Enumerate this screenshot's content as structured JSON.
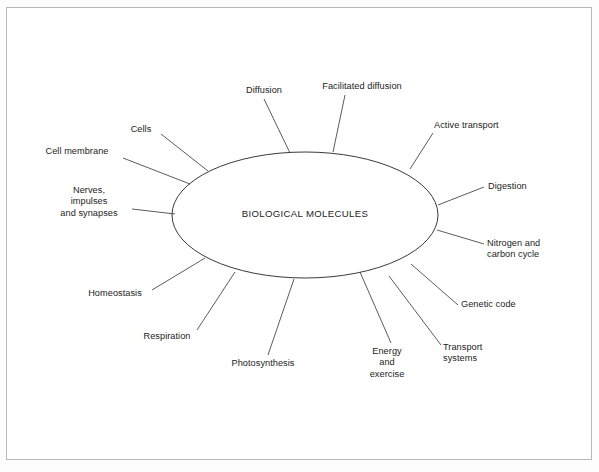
{
  "diagram": {
    "type": "mind-map",
    "center": {
      "label": "BIOLOGICAL MOLECULES",
      "shape": "ellipse",
      "cx": 305,
      "cy": 215,
      "rx": 133,
      "ry": 63
    },
    "style": {
      "page_background": "#fdfdfd",
      "frame_background": "#ffffff",
      "frame_border_color": "#b8b8b8",
      "line_color": "#4a4a4a",
      "ellipse_stroke": "#3a3a3a",
      "text_color": "#1c1c1c"
    },
    "branches": [
      {
        "id": "diffusion",
        "label": "Diffusion",
        "lines": [
          "Diffusion"
        ],
        "align": "center",
        "text_x": 236,
        "text_y": 85,
        "text_w": 56,
        "leader": {
          "x1": 264,
          "y1": 99,
          "x2": 290,
          "y2": 153
        }
      },
      {
        "id": "facilitated-diffusion",
        "label": "Facilitated diffusion",
        "lines": [
          "Facilitated diffusion"
        ],
        "align": "center",
        "text_x": 311,
        "text_y": 81,
        "text_w": 102,
        "leader": {
          "x1": 345,
          "y1": 95,
          "x2": 333,
          "y2": 152
        }
      },
      {
        "id": "active-transport",
        "label": "Active transport",
        "lines": [
          "Active transport"
        ],
        "align": "left",
        "text_x": 434,
        "text_y": 120,
        "text_w": 86,
        "leader": {
          "x1": 433,
          "y1": 133,
          "x2": 410,
          "y2": 169
        }
      },
      {
        "id": "digestion",
        "label": "Digestion",
        "lines": [
          "Digestion"
        ],
        "align": "left",
        "text_x": 488,
        "text_y": 181,
        "text_w": 52,
        "leader": {
          "x1": 484,
          "y1": 187,
          "x2": 438,
          "y2": 205
        }
      },
      {
        "id": "nitrogen-and-carbon-cycle",
        "label": "Nitrogen and carbon cycle",
        "lines": [
          "Nitrogen and",
          "carbon cycle"
        ],
        "align": "left",
        "text_x": 487,
        "text_y": 238,
        "text_w": 72,
        "leader": {
          "x1": 484,
          "y1": 244,
          "x2": 437,
          "y2": 230
        }
      },
      {
        "id": "genetic-code",
        "label": "Genetic code",
        "lines": [
          "Genetic code"
        ],
        "align": "left",
        "text_x": 461,
        "text_y": 299,
        "text_w": 70,
        "leader": {
          "x1": 458,
          "y1": 305,
          "x2": 411,
          "y2": 264
        }
      },
      {
        "id": "transport-systems",
        "label": "Transport systems",
        "lines": [
          "Transport",
          "systems"
        ],
        "align": "left",
        "text_x": 443,
        "text_y": 342,
        "text_w": 58,
        "leader": {
          "x1": 441,
          "y1": 345,
          "x2": 389,
          "y2": 276
        }
      },
      {
        "id": "energy-and-exercise",
        "label": "Energy and exercise",
        "lines": [
          "Energy",
          "and",
          "exercise"
        ],
        "align": "center",
        "text_x": 361,
        "text_y": 346,
        "text_w": 52,
        "leader": {
          "x1": 391,
          "y1": 343,
          "x2": 360,
          "y2": 272
        }
      },
      {
        "id": "photosynthesis",
        "label": "Photosynthesis",
        "lines": [
          "Photosynthesis"
        ],
        "align": "center",
        "text_x": 223,
        "text_y": 358,
        "text_w": 80,
        "leader": {
          "x1": 268,
          "y1": 355,
          "x2": 294,
          "y2": 279
        }
      },
      {
        "id": "respiration",
        "label": "Respiration",
        "lines": [
          "Respiration"
        ],
        "align": "center",
        "text_x": 136,
        "text_y": 331,
        "text_w": 62,
        "leader": {
          "x1": 197,
          "y1": 330,
          "x2": 235,
          "y2": 272
        }
      },
      {
        "id": "homeostasis",
        "label": "Homeostasis",
        "lines": [
          "Homeostasis"
        ],
        "align": "center",
        "text_x": 80,
        "text_y": 288,
        "text_w": 70,
        "leader": {
          "x1": 152,
          "y1": 290,
          "x2": 205,
          "y2": 258
        }
      },
      {
        "id": "nerves-impulses-and-synapses",
        "label": "Nerves, impulses and synapses",
        "lines": [
          "Nerves,",
          "impulses",
          "and synapses"
        ],
        "align": "center",
        "text_x": 50,
        "text_y": 185,
        "text_w": 78,
        "leader": {
          "x1": 132,
          "y1": 209,
          "x2": 175,
          "y2": 214
        }
      },
      {
        "id": "cell-membrane",
        "label": "Cell membrane",
        "lines": [
          "Cell membrane"
        ],
        "align": "center",
        "text_x": 35,
        "text_y": 146,
        "text_w": 84,
        "leader": {
          "x1": 123,
          "y1": 158,
          "x2": 190,
          "y2": 184
        }
      },
      {
        "id": "cells",
        "label": "Cells",
        "lines": [
          "Cells"
        ],
        "align": "center",
        "text_x": 125,
        "text_y": 124,
        "text_w": 32,
        "leader": {
          "x1": 161,
          "y1": 134,
          "x2": 208,
          "y2": 171
        }
      }
    ]
  }
}
